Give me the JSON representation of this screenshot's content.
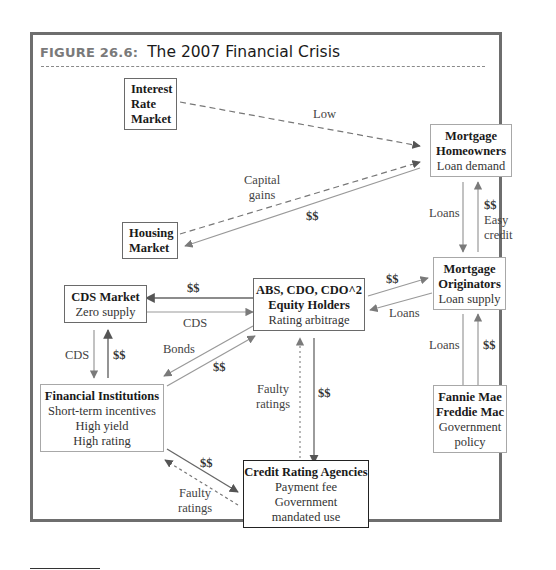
{
  "figure": {
    "label": "FIGURE 26.6:",
    "title": "The 2007 Financial Crisis"
  },
  "nodes": {
    "interest_rate_market": {
      "lines": [
        "Interest",
        "Rate",
        "Market"
      ]
    },
    "housing_market": {
      "lines": [
        "Housing",
        "Market"
      ]
    },
    "mortgage_homeowners": {
      "title": "Mortgage Homeowners",
      "title_l1": "Mortgage",
      "title_l2": "Homeowners",
      "subtitle": "Loan demand"
    },
    "mortgage_originators": {
      "title_l1": "Mortgage",
      "title_l2": "Originators",
      "subtitle": "Loan supply"
    },
    "abs_cdo": {
      "title_l1": "ABS, CDO, CDO^2",
      "title_l2": "Equity Holders",
      "subtitle": "Rating arbitrage"
    },
    "cds_market": {
      "title": "CDS Market",
      "subtitle": "Zero supply"
    },
    "financial_institutions": {
      "title": "Financial Institutions",
      "lines": [
        "Short-term incentives",
        "High yield",
        "High rating"
      ]
    },
    "fannie_freddie": {
      "title_l1": "Fannie Mae",
      "title_l2": "Freddie Mac",
      "lines": [
        "Government",
        "policy"
      ]
    },
    "credit_rating_agencies": {
      "title": "Credit Rating Agencies",
      "lines": [
        "Payment fee",
        "Government",
        "mandated use"
      ]
    }
  },
  "edges": [
    {
      "from": "Interest Rate Market",
      "to": "Mortgage Homeowners",
      "label": "Low",
      "style": "dashed"
    },
    {
      "from": "Housing Market",
      "to": "Mortgage Homeowners",
      "label_l1": "Capital",
      "label_l2": "gains",
      "style": "dashed"
    },
    {
      "from": "Mortgage Homeowners",
      "to": "Housing Market",
      "label": "$$",
      "style": "solid"
    },
    {
      "from": "Mortgage Homeowners",
      "to": "Mortgage Originators",
      "label": "Loans",
      "direction": "down"
    },
    {
      "from": "Mortgage Originators",
      "to": "Mortgage Homeowners",
      "label_l1": "$$",
      "label_l2": "Easy",
      "label_l3": "credit"
    },
    {
      "from": "ABS, CDO, CDO^2",
      "to": "Mortgage Originators",
      "label": "$$"
    },
    {
      "from": "Mortgage Originators",
      "to": "ABS, CDO, CDO^2",
      "label": "Loans"
    },
    {
      "from": "Mortgage Originators",
      "to": "Fannie Mae Freddie Mac",
      "label": "Loans"
    },
    {
      "from": "Fannie Mae Freddie Mac",
      "to": "Mortgage Originators",
      "label": "$$"
    },
    {
      "from": "ABS, CDO, CDO^2",
      "to": "CDS Market",
      "label": "$$"
    },
    {
      "from": "CDS Market",
      "to": "ABS, CDO, CDO^2",
      "label": "CDS"
    },
    {
      "from": "CDS Market",
      "to": "Financial Institutions",
      "label": "CDS"
    },
    {
      "from": "Financial Institutions",
      "to": "CDS Market",
      "label": "$$"
    },
    {
      "from": "ABS, CDO, CDO^2",
      "to": "Financial Institutions",
      "label": "Bonds"
    },
    {
      "from": "Financial Institutions",
      "to": "ABS, CDO, CDO^2",
      "label": "$$"
    },
    {
      "from": "Credit Rating Agencies",
      "to": "ABS, CDO, CDO^2",
      "label_l1": "Faulty",
      "label_l2": "ratings",
      "style": "dotted"
    },
    {
      "from": "ABS, CDO, CDO^2",
      "to": "Credit Rating Agencies",
      "label": "$$"
    },
    {
      "from": "Financial Institutions",
      "to": "Credit Rating Agencies",
      "label": "$$"
    },
    {
      "from": "Credit Rating Agencies",
      "to": "Financial Institutions",
      "label_l1": "Faulty",
      "label_l2": "ratings",
      "style": "dotted"
    }
  ],
  "labels": {
    "low": "Low",
    "capital": "Capital",
    "gains": "gains",
    "dollars": "$$",
    "loans": "Loans",
    "easy": "Easy",
    "credit": "credit",
    "cds": "CDS",
    "bonds": "Bonds",
    "faulty": "Faulty",
    "ratings": "ratings"
  },
  "colors": {
    "frame": "#6e6e6e",
    "arrow": "#8c8c8c",
    "arrow_dark": "#6a6a6a",
    "title_label": "#7a7a7a"
  }
}
